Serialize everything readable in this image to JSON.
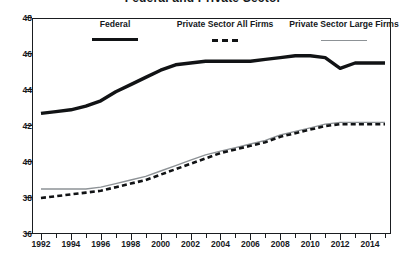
{
  "chart_data": {
    "type": "line",
    "title": "Federal and Private Sector",
    "xlabel": "",
    "ylabel": "",
    "xlim": [
      1991.4,
      2015.4
    ],
    "ylim": [
      36,
      48
    ],
    "yticks": [
      36,
      38,
      40,
      42,
      44,
      46,
      48
    ],
    "xticks": [
      1992,
      1994,
      1996,
      1998,
      2000,
      2002,
      2004,
      2006,
      2008,
      2010,
      2012,
      2014
    ],
    "x_minor_ticks": [
      1993,
      1995,
      1997,
      1999,
      2001,
      2003,
      2005,
      2007,
      2009,
      2011,
      2013,
      2015
    ],
    "grid": false,
    "legend_position": "top-inside",
    "x": [
      1992,
      1993,
      1994,
      1995,
      1996,
      1997,
      1998,
      1999,
      2000,
      2001,
      2002,
      2003,
      2004,
      2005,
      2006,
      2007,
      2008,
      2009,
      2010,
      2011,
      2012,
      2013,
      2014,
      2015
    ],
    "series": [
      {
        "name": "Federal",
        "style": "solid-thick-black",
        "color": "#111315",
        "values": [
          42.7,
          42.8,
          42.9,
          43.1,
          43.4,
          43.9,
          44.3,
          44.7,
          45.1,
          45.4,
          45.5,
          45.6,
          45.6,
          45.6,
          45.6,
          45.7,
          45.8,
          45.9,
          45.9,
          45.8,
          45.2,
          45.5,
          45.5,
          45.5
        ]
      },
      {
        "name": "Private Sector All Firms",
        "style": "dashed-black",
        "color": "#111315",
        "values": [
          38.0,
          38.1,
          38.2,
          38.3,
          38.4,
          38.6,
          38.8,
          39.0,
          39.3,
          39.6,
          39.9,
          40.2,
          40.5,
          40.7,
          40.9,
          41.1,
          41.4,
          41.6,
          41.8,
          42.0,
          42.1,
          42.1,
          42.1,
          42.1
        ]
      },
      {
        "name": "Private Sector Large Firms",
        "style": "solid-thin-gray",
        "color": "#8d9296",
        "values": [
          38.5,
          38.5,
          38.5,
          38.5,
          38.6,
          38.8,
          39.0,
          39.2,
          39.5,
          39.8,
          40.1,
          40.4,
          40.6,
          40.8,
          41.0,
          41.2,
          41.5,
          41.7,
          41.9,
          42.1,
          42.2,
          42.2,
          42.2,
          42.2
        ]
      }
    ]
  }
}
